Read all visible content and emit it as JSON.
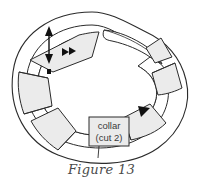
{
  "figure": {
    "caption": "Figure 13",
    "type": "sewing-pattern-diagram"
  },
  "labels": {
    "collar_line1": "collar",
    "collar_line2": "(cut 2)"
  },
  "colors": {
    "panel_fill": "#ebebeb",
    "outline": "#2b2b2b",
    "background": "#ffffff",
    "notch_fill": "#111111",
    "caption_color": "#4a4a4a"
  },
  "annotations": {
    "grainline_arrow": "double-headed-arrow",
    "notch_marks": "triangle-notch",
    "notch_count": 4
  }
}
